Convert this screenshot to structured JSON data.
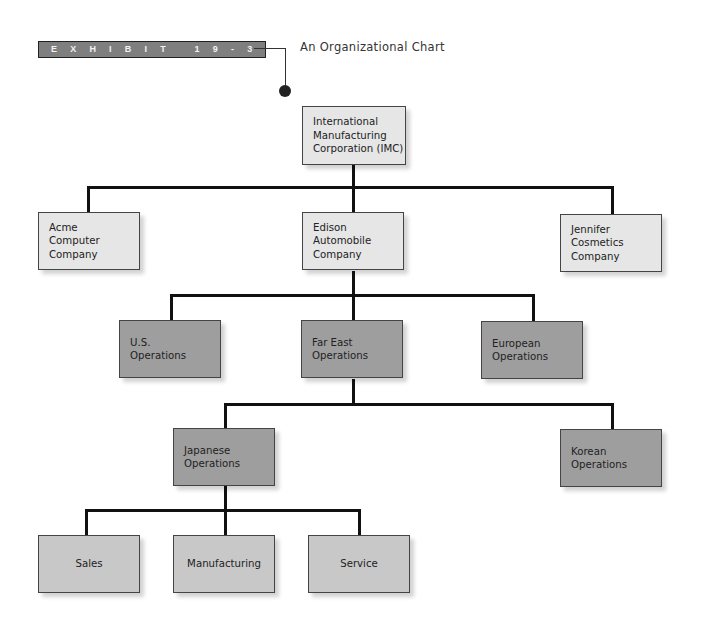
{
  "header": {
    "exhibit_label": "EXHIBIT 19-3",
    "title": "An Organizational Chart"
  },
  "nodes": {
    "imc": [
      "International",
      "Manufacturing",
      "Corporation (IMC)"
    ],
    "acme": [
      "Acme",
      "Computer",
      "Company"
    ],
    "edison": [
      "Edison",
      "Automobile",
      "Company"
    ],
    "jennifer": [
      "Jennifer",
      "Cosmetics",
      "Company"
    ],
    "us_ops": [
      "U.S.",
      "Operations"
    ],
    "far_east_ops": [
      "Far East",
      "Operations"
    ],
    "european_ops": [
      "European",
      "Operations"
    ],
    "japanese_ops": [
      "Japanese",
      "Operations"
    ],
    "korean_ops": [
      "Korean",
      "Operations"
    ],
    "sales": [
      "Sales"
    ],
    "manufacturing": [
      "Manufacturing"
    ],
    "service": [
      "Service"
    ]
  },
  "colors": {
    "level_company": "#e6e6e6",
    "level_region": "#9e9e9e",
    "level_function": "#c8c8c8",
    "connector": "#111111"
  }
}
